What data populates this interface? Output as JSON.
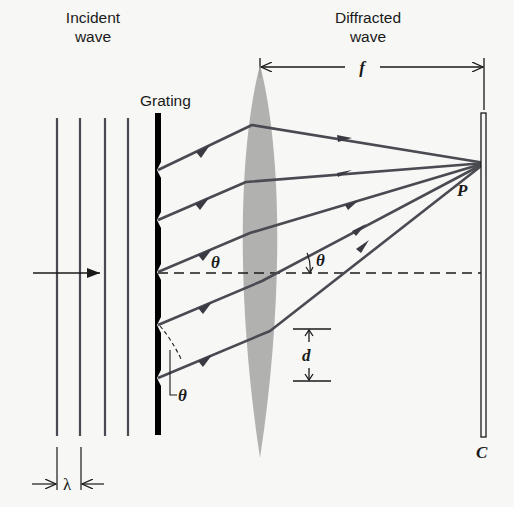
{
  "labels": {
    "incident_line1": "Incident",
    "incident_line2": "wave",
    "diffracted_line1": "Diffracted",
    "diffracted_line2": "wave",
    "grating": "Grating",
    "focal_length": "f",
    "point": "P",
    "screen": "C",
    "angle_left": "θ",
    "angle_right": "θ",
    "angle_bottom": "θ",
    "slit_spacing": "d",
    "wavelength": "λ"
  },
  "colors": {
    "background": "#f7f7f5",
    "ink": "#1a1a1a",
    "ray": "#4a4a52",
    "lens": "#a8a8a8",
    "grating": "#000000"
  },
  "geometry": {
    "wavefront_x": [
      57,
      80,
      105,
      128
    ],
    "slit_y": [
      170,
      220,
      272,
      325,
      378
    ],
    "focus_point": [
      485,
      163
    ],
    "axis_y": 273
  }
}
